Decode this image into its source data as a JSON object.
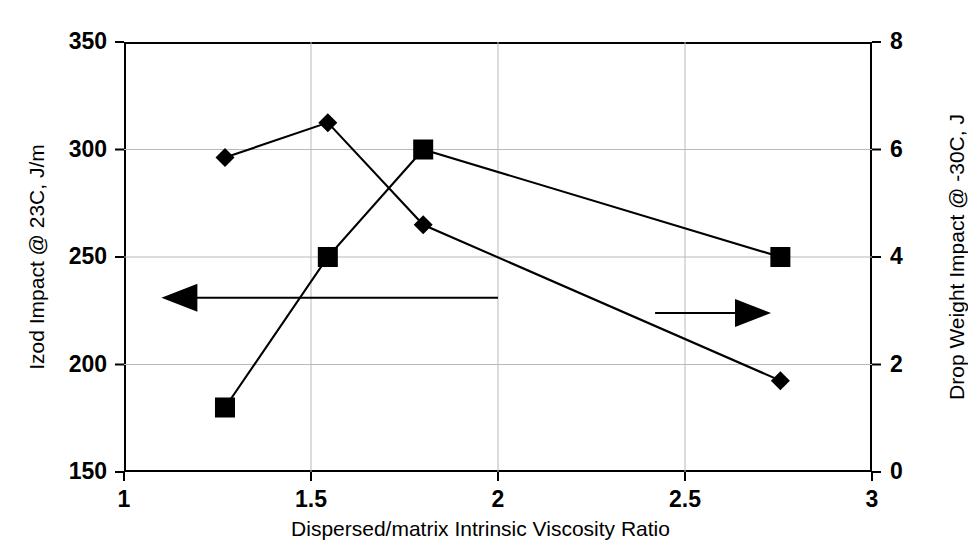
{
  "chart_data": {
    "type": "line",
    "title": "",
    "xlabel": "Dispersed/matrix Intrinsic Viscosity Ratio",
    "ylabel": "Izod Impact @ 23C, J/m",
    "ylabel_right": "Drop Weight Impact @ -30C, J",
    "xlim": [
      1,
      3
    ],
    "ylim": [
      150,
      350
    ],
    "ylim_right": [
      0,
      8
    ],
    "xticks": [
      "1",
      "1.5",
      "2",
      "2.5",
      "3"
    ],
    "xtick_values": [
      1,
      1.5,
      2,
      2.5,
      3
    ],
    "yticks_left": [
      "150",
      "200",
      "250",
      "300",
      "350"
    ],
    "ytick_values_left": [
      150,
      200,
      250,
      300,
      350
    ],
    "yticks_right": [
      "0",
      "2",
      "4",
      "6",
      "8"
    ],
    "ytick_values_right": [
      0,
      2,
      4,
      6,
      8
    ],
    "grid": true,
    "legend": "none",
    "series": [
      {
        "name": "Izod Impact @ 23C, J/m",
        "marker": "square",
        "axis": "left",
        "color": "#000000",
        "points": [
          {
            "x": 1.27,
            "y": 180
          },
          {
            "x": 1.545,
            "y": 250
          },
          {
            "x": 1.8,
            "y": 300
          },
          {
            "x": 2.755,
            "y": 250
          }
        ]
      },
      {
        "name": "Drop Weight Impact @ -30C, J",
        "marker": "diamond",
        "axis": "right",
        "color": "#000000",
        "points": [
          {
            "x": 1.27,
            "y": 5.85
          },
          {
            "x": 1.545,
            "y": 6.5
          },
          {
            "x": 1.8,
            "y": 4.6
          },
          {
            "x": 2.755,
            "y": 1.7
          }
        ]
      }
    ],
    "annotations": [
      {
        "name": "left-arrow",
        "type": "arrow",
        "direction": "left",
        "x_from": 2.0,
        "x_to": 1.1,
        "y_left": 231
      },
      {
        "name": "right-arrow",
        "type": "arrow",
        "direction": "right",
        "x_from": 2.42,
        "x_to": 2.73,
        "y_left": 224
      }
    ]
  }
}
